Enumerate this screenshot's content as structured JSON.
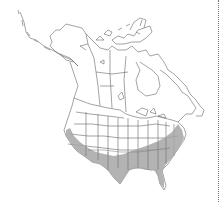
{
  "map": {
    "type": "species-range-map",
    "region": "North America",
    "colors": {
      "background": "#ffffff",
      "outline": "#555555",
      "range_fill": "#a6a6a6",
      "divider": "#777777"
    },
    "layers": [
      {
        "name": "country-and-province-boundaries",
        "style": "thin grey outlines"
      },
      {
        "name": "range",
        "description": "Shaded range across southern United States from California east to the Carolinas and Florida"
      }
    ]
  },
  "divider": {
    "style": "dotted",
    "orientation": "vertical"
  }
}
